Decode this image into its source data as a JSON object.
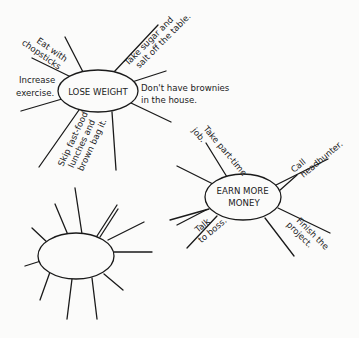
{
  "diagram": {
    "type": "mind-map",
    "clusters": [
      {
        "id": "lose-weight",
        "center_label": "LOSE WEIGHT",
        "branches": [
          {
            "lines": [
              "Eat with",
              "chopsticks"
            ]
          },
          {
            "lines": [
              "Take sugar and",
              "salt off the table."
            ]
          },
          {
            "lines": [
              "Increase",
              "exercise."
            ]
          },
          {
            "lines": [
              "Don't have brownies",
              "in the house."
            ]
          },
          {
            "lines": [
              "Skip fast-food",
              "lunches and",
              "brown bag it."
            ]
          }
        ]
      },
      {
        "id": "earn-more-money",
        "center_label_lines": [
          "EARN MORE",
          "MONEY"
        ],
        "branches": [
          {
            "lines": [
              "Take part-time",
              "job."
            ]
          },
          {
            "lines": [
              "Call",
              "headhunter."
            ]
          },
          {
            "lines": [
              "Talk",
              "to boss."
            ]
          },
          {
            "lines": [
              "Finish the",
              "project."
            ]
          }
        ]
      },
      {
        "id": "blank",
        "center_label": "",
        "branches": []
      }
    ]
  }
}
